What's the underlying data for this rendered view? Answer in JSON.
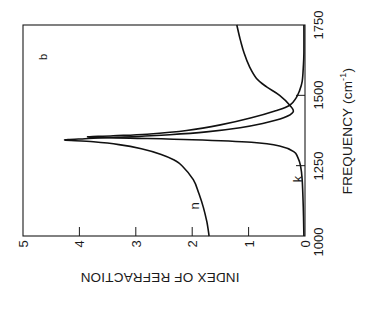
{
  "chart_data": {
    "type": "line",
    "orientation_note": "figure rendered rotated 90 degrees counter-clockwise",
    "panel_label": "b",
    "xlabel": "FREQUENCY (cm",
    "xlabel_sup": "-1",
    "xlabel_close": ")",
    "ylabel": "INDEX OF REFRACTION",
    "xlim": [
      1000,
      1750
    ],
    "ylim": [
      0,
      5
    ],
    "xticks": [
      "1000",
      "1250",
      "1500",
      "1750"
    ],
    "yticks": [
      "0",
      "1",
      "2",
      "3",
      "4",
      "5"
    ],
    "grid": false,
    "legend": "inline curve labels",
    "series": [
      {
        "name": "n",
        "x": [
          1000,
          1050,
          1100,
          1150,
          1200,
          1250,
          1270,
          1290,
          1310,
          1325,
          1335,
          1341,
          1346,
          1352,
          1360,
          1370,
          1385,
          1400,
          1420,
          1441,
          1465,
          1500,
          1530,
          1560,
          1600,
          1650,
          1700,
          1750
        ],
        "values": [
          1.7,
          1.74,
          1.8,
          1.88,
          1.98,
          2.18,
          2.32,
          2.55,
          2.9,
          3.3,
          3.75,
          4.26,
          3.9,
          3.2,
          2.4,
          1.75,
          1.15,
          0.75,
          0.38,
          0.21,
          0.27,
          0.45,
          0.68,
          0.86,
          0.98,
          1.08,
          1.15,
          1.21
        ]
      },
      {
        "name": "k",
        "x": [
          1000,
          1100,
          1200,
          1250,
          1280,
          1300,
          1320,
          1333,
          1342,
          1348,
          1352,
          1356,
          1362,
          1375,
          1395,
          1420,
          1445,
          1465,
          1490,
          1515,
          1550,
          1600,
          1650,
          1750
        ],
        "values": [
          0.02,
          0.03,
          0.05,
          0.08,
          0.13,
          0.2,
          0.45,
          0.95,
          2.0,
          3.1,
          3.85,
          3.4,
          2.8,
          2.1,
          1.5,
          0.95,
          0.52,
          0.27,
          0.16,
          0.1,
          0.05,
          0.03,
          0.02,
          0.02
        ]
      }
    ],
    "annotations": [
      {
        "text": "n",
        "near_x": 1120,
        "near_y": 2.0
      },
      {
        "text": "k",
        "near_x": 1200,
        "near_y": 0.2
      },
      {
        "text": "b",
        "near_x": 1640,
        "near_y": 4.65
      }
    ]
  }
}
